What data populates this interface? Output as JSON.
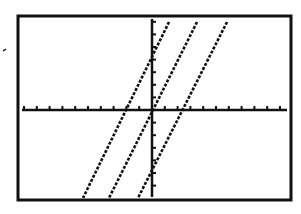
{
  "screen": {
    "type": "graphing-calculator-window",
    "frame": {
      "left": 18,
      "top": 16,
      "right": 291,
      "bottom": 200
    },
    "background": "#ffffff",
    "ink": "#111111"
  },
  "axes": {
    "x_axis_pixel_y": 110,
    "y_axis_pixel_x": 152,
    "x_tick_spacing_px": 12.8,
    "y_tick_spacing_px": 12.6,
    "xmin": -10,
    "xmax": 11,
    "ymin": -7,
    "ymax": 7
  },
  "graphs": [
    {
      "name": "line-left",
      "top": {
        "x": 169,
        "y": 22
      },
      "bottom": {
        "x": 83,
        "y": 198
      }
    },
    {
      "name": "line-middle",
      "top": {
        "x": 197,
        "y": 22
      },
      "bottom": {
        "x": 109,
        "y": 198
      }
    },
    {
      "name": "line-right",
      "top": {
        "x": 227,
        "y": 22
      },
      "bottom": {
        "x": 138,
        "y": 198
      }
    }
  ],
  "stray_mark": {
    "x": 3,
    "y": 51
  }
}
